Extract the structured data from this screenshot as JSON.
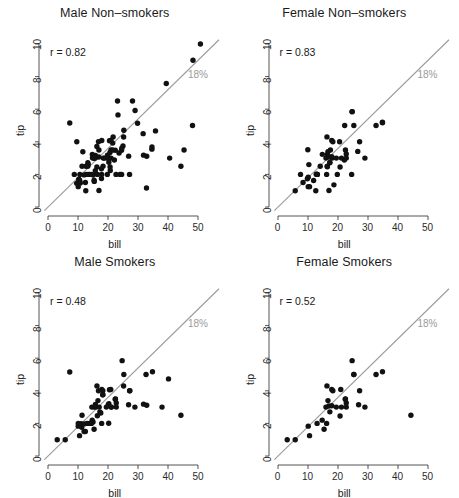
{
  "figure": {
    "background": "#ffffff",
    "point_color": "#111111",
    "line_color": "#9b9b9b",
    "label_color": "#9a9a9a",
    "axis_color": "#2a2a2a"
  },
  "axes": {
    "xlabel": "bill",
    "ylabel": "tip",
    "xticks": [
      0,
      10,
      20,
      30,
      40,
      50
    ],
    "yticks": [
      0,
      2,
      4,
      6,
      8,
      10
    ],
    "xlim": [
      -2,
      56
    ],
    "ylim": [
      -0.4,
      10.6
    ]
  },
  "reference_line": {
    "label": "18%",
    "slope": 0.18,
    "intercept": 0
  },
  "chart_data": [
    {
      "type": "scatter",
      "title": "Male Non–smokers",
      "xlabel": "bill",
      "ylabel": "tip",
      "annotation": "r = 0.82",
      "r": 0.82,
      "xlim": [
        -2,
        56
      ],
      "ylim": [
        -0.4,
        10.6
      ],
      "grid": false,
      "reference_line_label": "18%",
      "n": 97,
      "x": [
        16.99,
        10.34,
        21.01,
        23.68,
        24.59,
        25.29,
        8.77,
        26.88,
        15.04,
        14.78,
        10.27,
        15.42,
        18.43,
        14.83,
        21.58,
        10.33,
        16.29,
        16.97,
        20.65,
        17.92,
        20.29,
        15.77,
        39.42,
        19.82,
        17.81,
        13.37,
        12.69,
        21.7,
        19.65,
        9.55,
        18.35,
        15.06,
        20.69,
        16.93,
        16.29,
        20.45,
        13.28,
        22.12,
        24.01,
        15.69,
        11.61,
        10.77,
        15.53,
        10.07,
        12.6,
        32.83,
        35.83,
        29.03,
        27.18,
        22.67,
        17.82,
        18.78,
        24.55,
        19.77,
        29.85,
        48.17,
        25.0,
        13.39,
        16.49,
        21.5,
        12.66,
        13.81,
        24.52,
        20.76,
        31.71,
        10.59,
        10.63,
        50.81,
        15.81,
        7.25,
        31.85,
        16.82,
        32.9,
        17.89,
        14.48,
        9.6,
        34.63,
        34.65,
        23.33,
        45.35,
        23.17,
        40.55,
        20.92,
        48.33,
        13.27,
        28.17,
        12.02,
        21.01,
        12.46,
        11.35,
        15.38,
        44.3,
        22.42,
        20.92,
        15.36,
        20.49,
        25.21
      ],
      "y": [
        1.01,
        1.66,
        3.5,
        3.31,
        3.61,
        4.71,
        2.0,
        3.12,
        1.96,
        3.23,
        1.71,
        1.57,
        3.0,
        3.02,
        3.92,
        1.67,
        3.71,
        3.5,
        3.35,
        4.08,
        2.75,
        2.23,
        7.58,
        3.18,
        2.34,
        2.0,
        2.0,
        4.3,
        3.0,
        1.45,
        2.5,
        3.0,
        2.45,
        3.07,
        2.45,
        3.0,
        2.72,
        2.88,
        2.0,
        3.0,
        3.39,
        1.47,
        3.0,
        1.25,
        1.0,
        1.17,
        4.67,
        5.92,
        2.0,
        2.0,
        1.75,
        3.0,
        2.0,
        2.0,
        5.14,
        5.0,
        3.75,
        2.61,
        2.0,
        3.5,
        2.5,
        2.0,
        3.48,
        2.24,
        4.5,
        1.61,
        2.0,
        10.0,
        3.16,
        5.15,
        3.18,
        4.0,
        3.11,
        2.0,
        2.0,
        4.0,
        3.55,
        3.68,
        5.65,
        3.5,
        6.5,
        3.0,
        4.08,
        9.0,
        2.5,
        6.5,
        1.97,
        3.0,
        1.5,
        2.5,
        3.0,
        2.5,
        3.48,
        4.08,
        1.64,
        4.06,
        4.29
      ]
    },
    {
      "type": "scatter",
      "title": "Female Non–smokers",
      "xlabel": "bill",
      "ylabel": "tip",
      "annotation": "r = 0.83",
      "r": 0.83,
      "xlim": [
        -2,
        56
      ],
      "ylim": [
        -0.4,
        10.6
      ],
      "grid": false,
      "reference_line_label": "18%",
      "n": 54,
      "x": [
        16.99,
        10.29,
        34.81,
        9.94,
        22.23,
        24.71,
        18.04,
        17.47,
        16.45,
        8.35,
        18.64,
        11.87,
        9.78,
        7.51,
        14.07,
        13.13,
        17.26,
        24.55,
        19.77,
        10.07,
        12.6,
        12.74,
        13.0,
        16.4,
        20.53,
        16.47,
        26.59,
        22.12,
        14.78,
        10.51,
        17.92,
        27.2,
        22.76,
        17.29,
        19.44,
        16.66,
        10.07,
        32.68,
        15.98,
        34.83,
        13.03,
        18.28,
        24.71,
        21.16,
        28.97,
        22.49,
        5.75,
        16.32,
        22.75,
        17.92,
        20.69,
        16.93,
        25.28,
        16.21
      ],
      "y": [
        1.01,
        2.6,
        5.2,
        3.51,
        5.0,
        5.85,
        3.0,
        3.5,
        2.47,
        1.5,
        1.36,
        1.63,
        1.73,
        2.0,
        2.5,
        2.0,
        2.74,
        2.0,
        2.0,
        1.25,
        1.0,
        2.01,
        2.0,
        2.5,
        4.0,
        3.23,
        3.41,
        2.88,
        3.23,
        1.25,
        4.08,
        4.0,
        3.0,
        2.71,
        3.0,
        3.4,
        1.83,
        5.0,
        3.0,
        5.17,
        2.0,
        4.0,
        5.85,
        3.0,
        3.0,
        3.5,
        1.0,
        4.3,
        3.25,
        3.08,
        2.45,
        3.07,
        5.0,
        2.0
      ]
    },
    {
      "type": "scatter",
      "title": "Male Smokers",
      "xlabel": "bill",
      "ylabel": "tip",
      "annotation": "r = 0.48",
      "r": 0.48,
      "xlim": [
        -2,
        56
      ],
      "ylim": [
        -0.4,
        10.6
      ],
      "grid": false,
      "reference_line_label": "18%",
      "n": 60,
      "x": [
        38.01,
        11.24,
        20.29,
        13.81,
        11.02,
        18.29,
        17.59,
        20.08,
        16.45,
        3.07,
        20.23,
        15.01,
        12.02,
        17.07,
        26.86,
        25.28,
        14.73,
        10.51,
        17.92,
        27.2,
        22.76,
        17.29,
        19.44,
        16.66,
        10.07,
        32.68,
        15.98,
        34.83,
        13.03,
        18.28,
        24.71,
        21.16,
        28.97,
        22.49,
        5.75,
        16.32,
        22.75,
        40.17,
        27.28,
        12.03,
        21.01,
        12.46,
        11.35,
        15.38,
        44.3,
        22.42,
        20.92,
        15.36,
        20.49,
        25.21,
        18.24,
        14.61,
        10.09,
        15.81,
        7.25,
        31.85,
        16.82,
        32.9,
        17.89,
        14.48
      ],
      "y": [
        3.0,
        1.76,
        3.21,
        2.0,
        1.98,
        3.76,
        2.64,
        3.15,
        2.47,
        1.0,
        2.01,
        2.09,
        1.97,
        3.0,
        3.14,
        5.0,
        2.2,
        1.25,
        4.08,
        4.0,
        3.0,
        2.71,
        3.0,
        3.4,
        1.83,
        5.0,
        3.0,
        5.17,
        2.0,
        4.0,
        5.85,
        3.0,
        3.0,
        3.5,
        1.0,
        4.3,
        3.25,
        4.73,
        4.0,
        1.5,
        3.0,
        1.5,
        2.5,
        3.0,
        2.5,
        3.48,
        4.08,
        1.64,
        4.06,
        4.29,
        3.76,
        3.0,
        2.0,
        3.16,
        5.15,
        3.18,
        4.0,
        3.11,
        2.0,
        2.0
      ]
    },
    {
      "type": "scatter",
      "title": "Female Smokers",
      "xlabel": "bill",
      "ylabel": "tip",
      "annotation": "r = 0.52",
      "r": 0.52,
      "xlim": [
        -2,
        56
      ],
      "ylim": [
        -0.4,
        10.6
      ],
      "grid": false,
      "reference_line_label": "18%",
      "n": 33,
      "x": [
        3.07,
        26.86,
        25.28,
        14.73,
        10.51,
        17.92,
        27.2,
        22.76,
        17.29,
        19.44,
        16.66,
        10.07,
        32.68,
        15.98,
        34.83,
        13.03,
        18.28,
        24.71,
        21.16,
        28.97,
        22.49,
        5.75,
        16.32,
        22.75,
        17.92,
        20.69,
        16.93,
        25.28,
        16.21,
        44.3,
        22.42,
        20.92,
        15.36
      ],
      "y": [
        1.0,
        3.14,
        5.0,
        2.2,
        1.25,
        4.08,
        4.0,
        3.0,
        2.71,
        3.0,
        3.4,
        1.83,
        5.0,
        3.0,
        5.17,
        2.0,
        4.0,
        5.85,
        3.0,
        3.0,
        3.5,
        1.0,
        4.3,
        3.25,
        3.08,
        2.45,
        3.07,
        5.0,
        2.0,
        2.5,
        3.48,
        4.08,
        1.64
      ]
    }
  ]
}
